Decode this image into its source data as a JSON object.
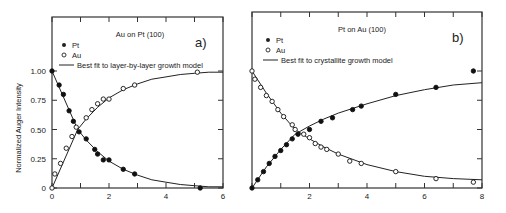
{
  "figure": {
    "ylabel": "Normalized Auger Intensity",
    "yticks": [
      "0",
      "0.25",
      "0.50",
      "0.75",
      "1.00"
    ]
  },
  "chart_data": [
    {
      "type": "scatter",
      "panel": "a)",
      "title": "Au on Pt (100)",
      "xlabel": "",
      "ylabel": "Normalized Auger Intensity",
      "xlim": [
        0,
        6
      ],
      "ylim": [
        0,
        1.0
      ],
      "xticks": [
        0,
        2,
        4,
        6
      ],
      "yticks": [
        0,
        0.25,
        0.5,
        0.75,
        1.0
      ],
      "legend": [
        "Pt",
        "Au",
        "Best fit to layer-by-layer growth model"
      ],
      "legend_position": "upper left",
      "series": [
        {
          "name": "Pt",
          "marker": "filled-circle",
          "x": [
            0,
            0.25,
            0.4,
            0.6,
            0.75,
            0.95,
            1.2,
            1.5,
            1.6,
            1.8,
            2.0,
            2.5,
            2.9,
            5.2
          ],
          "y": [
            1.0,
            0.88,
            0.8,
            0.66,
            0.57,
            0.48,
            0.42,
            0.33,
            0.29,
            0.24,
            0.24,
            0.16,
            0.12,
            0.0
          ]
        },
        {
          "name": "Au",
          "marker": "open-circle",
          "x": [
            0,
            0.1,
            0.3,
            0.5,
            0.7,
            0.85,
            1.2,
            1.4,
            1.6,
            1.8,
            2.0,
            2.5,
            2.9,
            5.1
          ],
          "y": [
            0,
            0.12,
            0.21,
            0.34,
            0.44,
            0.52,
            0.6,
            0.67,
            0.72,
            0.76,
            0.76,
            0.85,
            0.88,
            0.99
          ]
        },
        {
          "name": "Best fit Pt",
          "line": true,
          "x": [
            0,
            0.9,
            1.2,
            1.6,
            2.0,
            2.5,
            3.0,
            3.5,
            4.0,
            4.5,
            5.0,
            5.5,
            6.0
          ],
          "y": [
            1.0,
            0.5,
            0.41,
            0.31,
            0.23,
            0.16,
            0.11,
            0.07,
            0.05,
            0.03,
            0.02,
            0.01,
            0.01
          ]
        },
        {
          "name": "Best fit Au",
          "line": true,
          "x": [
            0,
            0.9,
            1.2,
            1.6,
            2.0,
            2.5,
            3.0,
            3.5,
            4.0,
            4.5,
            5.0,
            5.5,
            6.0
          ],
          "y": [
            0,
            0.5,
            0.59,
            0.69,
            0.77,
            0.84,
            0.89,
            0.93,
            0.95,
            0.97,
            0.98,
            0.99,
            0.99
          ]
        }
      ]
    },
    {
      "type": "scatter",
      "panel": "b)",
      "title": "Pt on Au (100)",
      "xlabel": "",
      "ylabel": "",
      "xlim": [
        0,
        8
      ],
      "ylim": [
        0,
        1.0
      ],
      "xticks": [
        2,
        4,
        6,
        8
      ],
      "yticks": [
        0,
        0.25,
        0.5,
        0.75,
        1.0
      ],
      "legend": [
        "Pt",
        "Au",
        "Best fit to crystallite growth model"
      ],
      "legend_position": "upper left",
      "series": [
        {
          "name": "Pt",
          "marker": "filled-circle",
          "x": [
            0,
            0.2,
            0.4,
            0.6,
            0.8,
            1.0,
            1.2,
            1.4,
            1.6,
            2.0,
            2.4,
            2.8,
            3.5,
            3.8,
            5.0,
            6.4,
            7.7
          ],
          "y": [
            0,
            0.07,
            0.14,
            0.21,
            0.27,
            0.32,
            0.37,
            0.42,
            0.46,
            0.5,
            0.57,
            0.6,
            0.67,
            0.7,
            0.8,
            0.86,
            1.0
          ]
        },
        {
          "name": "Au",
          "marker": "open-circle",
          "x": [
            0,
            0.1,
            0.3,
            0.5,
            0.7,
            0.9,
            1.1,
            1.4,
            1.5,
            1.8,
            2.0,
            2.2,
            2.4,
            2.6,
            3.0,
            3.4,
            3.8,
            5.0,
            6.4,
            7.7
          ],
          "y": [
            1.0,
            0.93,
            0.86,
            0.79,
            0.74,
            0.67,
            0.61,
            0.54,
            0.5,
            0.46,
            0.43,
            0.38,
            0.35,
            0.33,
            0.29,
            0.23,
            0.21,
            0.14,
            0.08,
            0.05
          ]
        },
        {
          "name": "Best fit Pt",
          "line": true,
          "x": [
            0,
            0.5,
            1.0,
            1.5,
            2.0,
            2.5,
            3.0,
            4.0,
            5.0,
            6.0,
            7.0,
            8.0
          ],
          "y": [
            0,
            0.18,
            0.33,
            0.46,
            0.53,
            0.59,
            0.64,
            0.72,
            0.79,
            0.84,
            0.88,
            0.9
          ]
        },
        {
          "name": "Best fit Au",
          "line": true,
          "x": [
            0,
            0.5,
            1.0,
            1.5,
            2.0,
            2.5,
            3.0,
            4.0,
            5.0,
            6.0,
            7.0,
            8.0
          ],
          "y": [
            1.0,
            0.81,
            0.64,
            0.5,
            0.42,
            0.35,
            0.29,
            0.2,
            0.14,
            0.1,
            0.08,
            0.07
          ]
        }
      ]
    }
  ]
}
